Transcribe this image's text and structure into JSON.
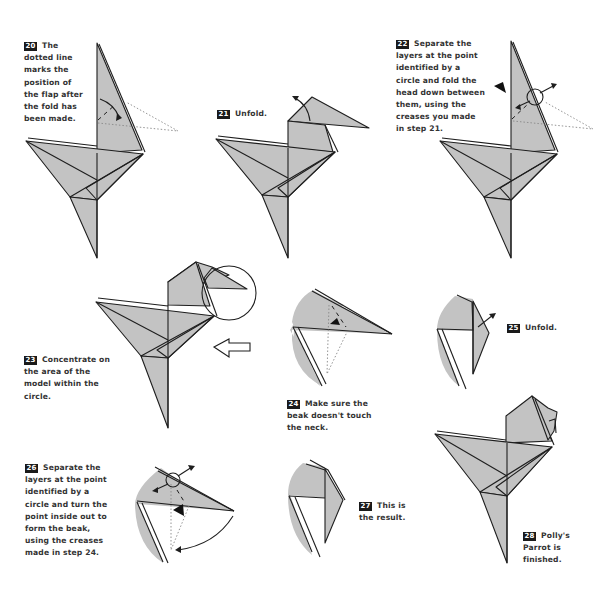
{
  "document": {
    "subject": "Origami instructions — Polly's Parrot, steps 20–28",
    "paper_color": "#c3c3c3",
    "line_color": "#1e1e1e",
    "badge_color": "#1a1a1a"
  },
  "steps": [
    {
      "number": "20",
      "text": "The dotted line marks the position of the flap after the fold has been made."
    },
    {
      "number": "21",
      "text": "Unfold."
    },
    {
      "number": "22",
      "text": "Separate the layers at the point identified by a circle and fold the head down between them, using the creases you made in step 21."
    },
    {
      "number": "23",
      "text": "Concentrate on the area of the model within the circle."
    },
    {
      "number": "24",
      "text": "Make sure the beak doesn't touch the neck."
    },
    {
      "number": "25",
      "text": "Unfold."
    },
    {
      "number": "26",
      "text": "Separate the layers at the point identified by a circle and turn the point inside out to form the beak, using the creases made in step 24."
    },
    {
      "number": "27",
      "text": "This is the result."
    },
    {
      "number": "28",
      "text": "Polly's Parrot is finished."
    }
  ]
}
